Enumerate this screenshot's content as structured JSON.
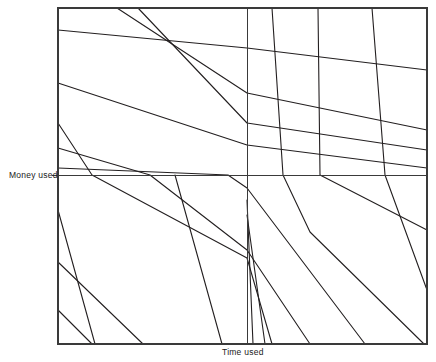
{
  "figure": {
    "title": "",
    "background_color": "#ffffff",
    "line_color": "#231f20",
    "frame_color": "#3a3a3a",
    "axis_color": "#3a3a3a",
    "y_axis_label": "Money used",
    "x_axis_label": "Time used",
    "frame": {
      "left": 58,
      "top": 8,
      "right": 427,
      "bottom": 344
    },
    "origin": {
      "x": 247,
      "y": 175
    }
  },
  "chart_data": {
    "type": "line",
    "title": "",
    "xlabel": "Time used",
    "ylabel": "Money used",
    "xlim": [
      58,
      427
    ],
    "ylim": [
      344,
      8
    ],
    "grid": false,
    "legend": null,
    "axes": {
      "vertical_divider_x": 247,
      "horizontal_divider_y": 175
    },
    "series": [
      {
        "name": "curve-1",
        "points": [
          [
            58,
            30
          ],
          [
            247,
            48
          ],
          [
            427,
            70
          ]
        ]
      },
      {
        "name": "curve-2",
        "points": [
          [
            117,
            8
          ],
          [
            247,
            93
          ],
          [
            427,
            130
          ]
        ]
      },
      {
        "name": "curve-3",
        "points": [
          [
            138,
            8
          ],
          [
            247,
            123
          ],
          [
            427,
            150
          ]
        ]
      },
      {
        "name": "curve-4",
        "points": [
          [
            58,
            83
          ],
          [
            247,
            145
          ],
          [
            427,
            168
          ]
        ]
      },
      {
        "name": "curve-5",
        "points": [
          [
            58,
            123
          ],
          [
            92,
            175
          ],
          [
            247,
            258
          ],
          [
            272,
            344
          ]
        ]
      },
      {
        "name": "curve-6",
        "points": [
          [
            58,
            148
          ],
          [
            150,
            175
          ],
          [
            247,
            250
          ],
          [
            310,
            344
          ]
        ]
      },
      {
        "name": "curve-7",
        "points": [
          [
            58,
            168
          ],
          [
            228,
            175
          ],
          [
            247,
            188
          ],
          [
            365,
            344
          ]
        ]
      },
      {
        "name": "curve-8",
        "points": [
          [
            272,
            8
          ],
          [
            283,
            175
          ],
          [
            310,
            232
          ],
          [
            424,
            344
          ]
        ]
      },
      {
        "name": "curve-9",
        "points": [
          [
            318,
            8
          ],
          [
            320,
            175
          ],
          [
            427,
            230
          ]
        ]
      },
      {
        "name": "curve-10",
        "points": [
          [
            372,
            8
          ],
          [
            385,
            175
          ],
          [
            427,
            290
          ]
        ]
      },
      {
        "name": "curve-11",
        "points": [
          [
            58,
            210
          ],
          [
            95,
            344
          ]
        ]
      },
      {
        "name": "curve-12",
        "points": [
          [
            58,
            262
          ],
          [
            143,
            344
          ]
        ]
      },
      {
        "name": "curve-13",
        "points": [
          [
            58,
            310
          ],
          [
            92,
            344
          ]
        ]
      },
      {
        "name": "curve-14",
        "points": [
          [
            247,
            200
          ],
          [
            253,
            344
          ]
        ]
      },
      {
        "name": "curve-15",
        "points": [
          [
            247,
            215
          ],
          [
            265,
            344
          ]
        ]
      },
      {
        "name": "curve-16",
        "points": [
          [
            175,
            175
          ],
          [
            222,
            344
          ]
        ]
      }
    ]
  }
}
